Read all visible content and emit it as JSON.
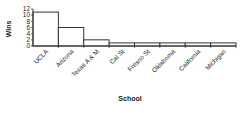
{
  "chart_data": {
    "type": "bar",
    "title": "",
    "xlabel": "School",
    "ylabel": "Wins",
    "categories": [
      "UCLA",
      "Arizona",
      "Texas A & M",
      "Cal St",
      "Fresno St",
      "Oklahoma",
      "California",
      "Michigan"
    ],
    "values": [
      11,
      6,
      2,
      1,
      1,
      1,
      1,
      1
    ],
    "ylim": [
      0,
      12
    ],
    "yticks": [
      0,
      2,
      4,
      6,
      8,
      10,
      12
    ],
    "grid": false,
    "legend": null,
    "bar_fill": "#ffffff",
    "bar_stroke": "#333333"
  }
}
